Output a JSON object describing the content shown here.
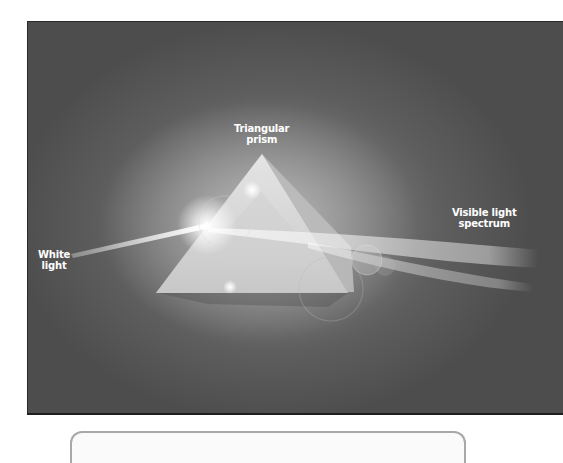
{
  "figure": {
    "labels": {
      "prism": [
        "Triangular",
        "prism"
      ],
      "input": [
        "White",
        "light"
      ],
      "output": [
        "Visible light",
        "spectrum"
      ]
    },
    "colors": {
      "background": "#5e5e5e",
      "glow": "#9a9a9a",
      "prism": "#d8d8d8",
      "text": "#ffffff"
    }
  }
}
